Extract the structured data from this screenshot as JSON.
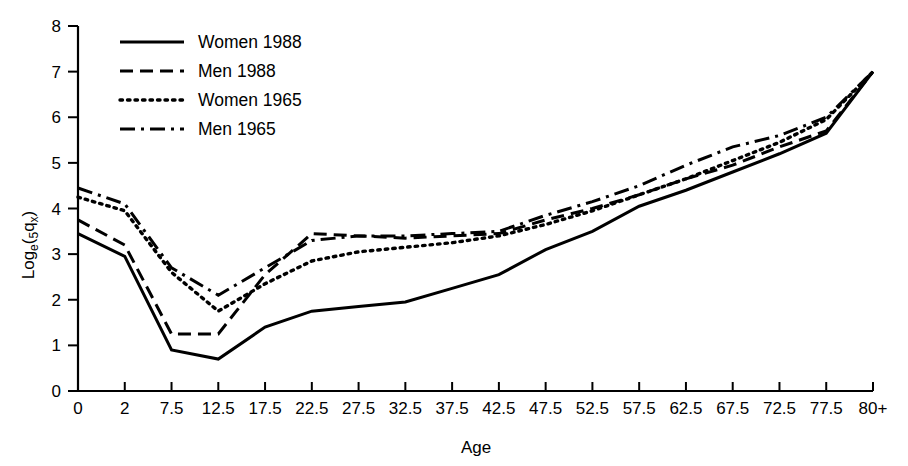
{
  "chart_data": {
    "type": "line",
    "title": "",
    "xlabel": "Age",
    "ylabel": "Log_e(5qx)",
    "ylabel_parts": {
      "main1": "Log",
      "sub1": "e",
      "paren_open": "(",
      "sub2": "5",
      "main2": "q",
      "sub3": "x",
      "paren_close": ")"
    },
    "categories": [
      "0",
      "2",
      "7.5",
      "12.5",
      "17.5",
      "22.5",
      "27.5",
      "32.5",
      "37.5",
      "42.5",
      "47.5",
      "52.5",
      "57.5",
      "62.5",
      "67.5",
      "72.5",
      "77.5",
      "80+"
    ],
    "xticklabels": [
      "0",
      "2",
      "7.5",
      "12.5",
      "17.5",
      "22.5",
      "27.5",
      "32.5",
      "37.5",
      "42.5",
      "47.5",
      "52.5",
      "57.5",
      "62.5",
      "67.5",
      "72.5",
      "77.5",
      "80+"
    ],
    "yticklabels": [
      "0",
      "1",
      "2",
      "3",
      "4",
      "5",
      "6",
      "7",
      "8"
    ],
    "ylim": [
      0,
      8
    ],
    "xlim": [
      0,
      17
    ],
    "grid": false,
    "legend_position": "top-left",
    "series": [
      {
        "name": "Women 1988",
        "style": "solid",
        "values": [
          3.45,
          2.95,
          0.9,
          0.7,
          1.4,
          1.75,
          1.85,
          1.95,
          2.25,
          2.55,
          3.1,
          3.5,
          4.05,
          4.4,
          4.8,
          5.2,
          5.65,
          7.0
        ]
      },
      {
        "name": "Men 1988",
        "style": "dashed",
        "values": [
          3.75,
          3.2,
          1.25,
          1.25,
          2.55,
          3.45,
          3.4,
          3.35,
          3.4,
          3.45,
          3.75,
          4.0,
          4.3,
          4.65,
          4.95,
          5.35,
          5.7,
          7.0
        ]
      },
      {
        "name": "Women 1965",
        "style": "dotted",
        "values": [
          4.25,
          3.95,
          2.6,
          1.75,
          2.35,
          2.85,
          3.05,
          3.15,
          3.25,
          3.4,
          3.65,
          3.95,
          4.3,
          4.65,
          5.05,
          5.45,
          5.95,
          7.0
        ]
      },
      {
        "name": "Men 1965",
        "style": "dashdot",
        "values": [
          4.45,
          4.1,
          2.7,
          2.1,
          2.7,
          3.3,
          3.4,
          3.4,
          3.45,
          3.5,
          3.85,
          4.15,
          4.5,
          4.95,
          5.35,
          5.6,
          6.0,
          7.0
        ]
      }
    ]
  },
  "legend": {
    "items": [
      {
        "label": "Women 1988",
        "style": "solid"
      },
      {
        "label": "Men 1988",
        "style": "dashed"
      },
      {
        "label": "Women 1965",
        "style": "dotted"
      },
      {
        "label": "Men 1965",
        "style": "dashdot"
      }
    ]
  },
  "colors": {
    "line": "#000000",
    "axis": "#000000",
    "background": "#ffffff"
  }
}
